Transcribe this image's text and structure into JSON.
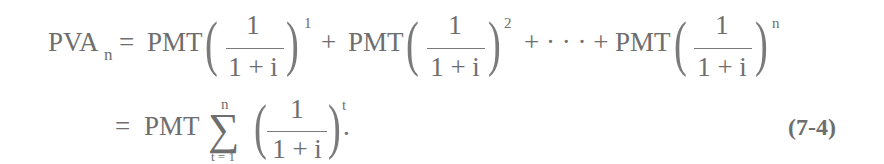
{
  "equation": {
    "number": "(7-4)",
    "line1": {
      "lhs": "PVA",
      "lhs_subscript": "n",
      "equals": "=",
      "terms": [
        {
          "coef": "PMT",
          "numerator": "1",
          "denominator": "1 + i",
          "exponent": "1"
        },
        {
          "coef": "PMT",
          "numerator": "1",
          "denominator": "1 + i",
          "exponent": "2"
        },
        {
          "coef": "PMT",
          "numerator": "1",
          "denominator": "1 + i",
          "exponent": "n"
        }
      ],
      "plus": "+",
      "ellipsis_plus": "+ · · · +"
    },
    "line2": {
      "equals": "=",
      "coef": "PMT",
      "sigma": "∑",
      "sum_upper": "n",
      "sum_lower": "t = 1",
      "numerator": "1",
      "denominator": "1 + i",
      "exponent": "t",
      "terminator": "."
    },
    "parens": {
      "open": "(",
      "close": ")"
    }
  }
}
